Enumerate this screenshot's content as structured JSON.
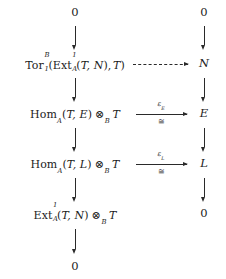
{
  "diagram": {
    "type": "commutative-diagram",
    "columns": 2,
    "rows": 6,
    "left_column": {
      "row1": {
        "text": "0"
      },
      "row2": {
        "functor": "Tor",
        "functor_sub": "1",
        "functor_sup": "B",
        "inner_functor": "Ext",
        "inner_sub": "A",
        "inner_sup": "1",
        "inner_args_open": "(",
        "inner_args": "T, N",
        "inner_args_close": ")",
        "outer_arg": "T",
        "open": "(",
        "close": ")",
        "comma": ","
      },
      "row3": {
        "functor": "Hom",
        "functor_sub": "A",
        "open": "(",
        "args": "T, E",
        "close": ")",
        "tensor": "⊗",
        "tensor_sub": "B",
        "module": "T"
      },
      "row4": {
        "functor": "Hom",
        "functor_sub": "A",
        "open": "(",
        "args": "T, L",
        "close": ")",
        "tensor": "⊗",
        "tensor_sub": "B",
        "module": "T"
      },
      "row5": {
        "functor": "Ext",
        "functor_sub": "A",
        "functor_sup": "1",
        "open": "(",
        "args": "T, N",
        "close": ")",
        "tensor": "⊗",
        "tensor_sub": "B",
        "module": "T"
      },
      "row6": {
        "text": "0"
      }
    },
    "right_column": {
      "row1": {
        "text": "0"
      },
      "row2": {
        "text": "N"
      },
      "row3": {
        "text": "E"
      },
      "row4": {
        "text": "L"
      },
      "row5": {
        "text": "0"
      }
    },
    "horizontal_arrows": [
      {
        "id": "dashed-arrow-tor-to-n",
        "style": "dashed",
        "label_above": "",
        "label_below": ""
      },
      {
        "id": "iso-arrow-e",
        "style": "solid",
        "label_above": "ε",
        "label_above_sub": "E",
        "label_below": "≅"
      },
      {
        "id": "iso-arrow-l",
        "style": "solid",
        "label_above": "ε",
        "label_above_sub": "L",
        "label_below": "≅"
      }
    ],
    "vertical_arrow_glyph": "↓",
    "colors": {
      "background": "#ffffff",
      "ink": "#1c1c1c",
      "arrow": "#2a2a2a"
    }
  }
}
